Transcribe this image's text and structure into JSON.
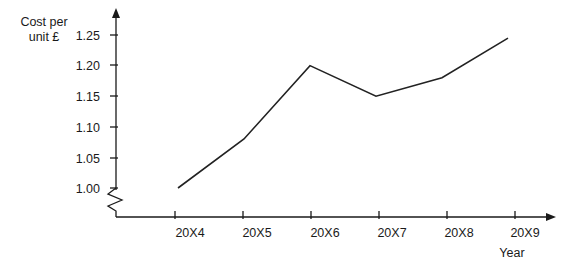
{
  "chart_data": {
    "type": "line",
    "title": "",
    "xlabel": "Year",
    "ylabel": "Cost per unit £",
    "ylabel_line1": "Cost per",
    "ylabel_line2": "unit £",
    "categories": [
      "20X4",
      "20X5",
      "20X6",
      "20X7",
      "20X8",
      "20X9"
    ],
    "values": [
      1.0,
      1.08,
      1.2,
      1.15,
      1.18,
      1.245
    ],
    "series": [
      {
        "name": "Cost per unit £",
        "values": [
          1.0,
          1.08,
          1.2,
          1.15,
          1.18,
          1.245
        ]
      }
    ],
    "ytick_labels": [
      "1.00",
      "1.05",
      "1.10",
      "1.15",
      "1.20",
      "1.25"
    ],
    "ytick_values": [
      1.0,
      1.05,
      1.1,
      1.15,
      1.2,
      1.25
    ],
    "ylim": [
      1.0,
      1.25
    ],
    "grid": false,
    "legend": "none",
    "axis_break": true,
    "axis_break_note": "zigzag break on y-axis below 1.00",
    "line_color": "#222222",
    "axis_color": "#1a1a1a",
    "background_color": "#ffffff"
  },
  "ylabels": {
    "l0": "1.00",
    "l1": "1.05",
    "l2": "1.10",
    "l3": "1.15",
    "l4": "1.20",
    "l5": "1.25"
  },
  "xlabels": {
    "c0": "20X4",
    "c1": "20X5",
    "c2": "20X6",
    "c3": "20X7",
    "c4": "20X8",
    "c5": "20X9"
  },
  "axis_titles": {
    "y_line1": "Cost per",
    "y_line2": "unit £",
    "x": "Year"
  }
}
